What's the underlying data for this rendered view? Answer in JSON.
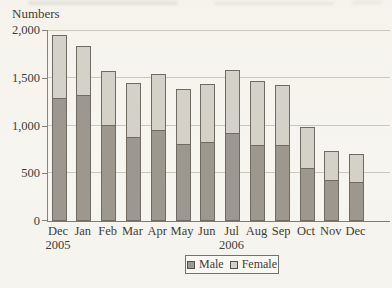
{
  "figure": {
    "axis_title": "Numbers",
    "legend": {
      "items": [
        {
          "label": "Male",
          "color": "#9c9890"
        },
        {
          "label": "Female",
          "color": "#d4d1c8"
        }
      ]
    }
  },
  "chart_data": {
    "type": "bar",
    "stacked": true,
    "ylabel": "Numbers",
    "categories": [
      "Dec",
      "Jan",
      "Feb",
      "Mar",
      "Apr",
      "May",
      "Jun",
      "Jul",
      "Aug",
      "Sep",
      "Oct",
      "Nov",
      "Dec"
    ],
    "year_labels": [
      {
        "category_index": 0,
        "label": "2005"
      },
      {
        "category_index": 7,
        "label": "2006"
      }
    ],
    "series": [
      {
        "name": "Male",
        "color": "#9c9890",
        "values": [
          1290,
          1320,
          1010,
          880,
          950,
          810,
          830,
          920,
          800,
          800,
          560,
          430,
          410
        ]
      },
      {
        "name": "Female",
        "color": "#d4d1c8",
        "values": [
          660,
          510,
          560,
          570,
          590,
          570,
          600,
          660,
          670,
          620,
          420,
          300,
          290
        ]
      }
    ],
    "totals": [
      1950,
      1830,
      1570,
      1450,
      1540,
      1380,
      1430,
      1580,
      1470,
      1420,
      980,
      730,
      700
    ],
    "ylim": [
      0,
      2000
    ],
    "ytick_interval": 500,
    "yticks": [
      {
        "value": 0,
        "label": "0"
      },
      {
        "value": 500,
        "label": "500"
      },
      {
        "value": 1000,
        "label": "1,000"
      },
      {
        "value": 1500,
        "label": "1,500"
      },
      {
        "value": 2000,
        "label": "2,000"
      }
    ],
    "grid": true,
    "legend_position": "bottom"
  }
}
